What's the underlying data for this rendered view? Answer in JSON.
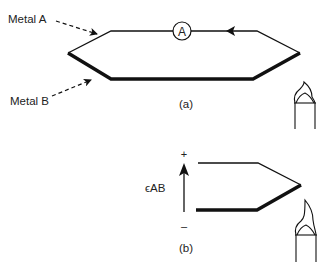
{
  "labels": {
    "metal_a": "Metal A",
    "metal_b": "Metal B",
    "ammeter": "A",
    "part_a": "(a)",
    "part_b": "(b)",
    "emf": "ϵAB",
    "plus": "+",
    "minus": "–"
  },
  "colors": {
    "line": "#111111",
    "text": "#222222",
    "background": "#ffffff"
  },
  "icons": {
    "ammeter": "ammeter-icon",
    "burner": "bunsen-burner-icon",
    "current_arrow": "arrowhead-left-icon",
    "emf_arrow": "arrow-up-icon"
  }
}
